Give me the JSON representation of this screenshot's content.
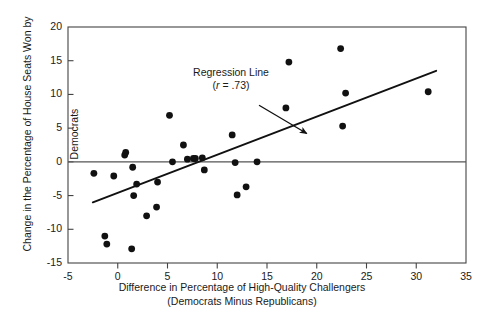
{
  "chart_data": {
    "type": "scatter",
    "title": "",
    "xlabel": "Difference in Percentage of High-Quality Challengers (Democrats Minus Republicans)",
    "xlabel_line1": "Difference in Percentage of High-Quality Challengers",
    "xlabel_line2": "(Democrats Minus Republicans)",
    "ylabel": "Change in the Percentage of House Seats Won by Democrats",
    "ylabel_line1": "Change in the Percentage of House Seats Won by",
    "ylabel_line2": "Democrats",
    "xlim": [
      -5,
      35
    ],
    "ylim": [
      -15,
      20
    ],
    "xticks": [
      -5,
      0,
      5,
      10,
      15,
      20,
      25,
      30,
      35
    ],
    "xtick_labels": [
      "-5",
      "0",
      "5",
      "10",
      "15",
      "20",
      "25",
      "30",
      "35"
    ],
    "yticks": [
      -15,
      -10,
      -5,
      0,
      5,
      10,
      15,
      20
    ],
    "ytick_labels": [
      "-15",
      "-10",
      "-5",
      "0",
      "5",
      "10",
      "15",
      "20"
    ],
    "grid": false,
    "legend": null,
    "zero_line": 0,
    "point_color": "#111111",
    "point_size": 3.4,
    "line_color": "#111111",
    "points": [
      {
        "x": -2.4,
        "y": -1.7
      },
      {
        "x": -1.3,
        "y": -11.0
      },
      {
        "x": -1.1,
        "y": -12.2
      },
      {
        "x": -0.4,
        "y": -2.1
      },
      {
        "x": 0.7,
        "y": 1.0
      },
      {
        "x": 0.8,
        "y": 1.4
      },
      {
        "x": 1.4,
        "y": -12.9
      },
      {
        "x": 1.5,
        "y": -0.8
      },
      {
        "x": 1.6,
        "y": -5.0
      },
      {
        "x": 1.9,
        "y": -3.3
      },
      {
        "x": 2.9,
        "y": -8.0
      },
      {
        "x": 3.9,
        "y": -6.7
      },
      {
        "x": 4.0,
        "y": -3.0
      },
      {
        "x": 5.2,
        "y": 6.9
      },
      {
        "x": 5.5,
        "y": 0.0
      },
      {
        "x": 6.6,
        "y": 2.5
      },
      {
        "x": 7.0,
        "y": 0.4
      },
      {
        "x": 7.6,
        "y": 0.5
      },
      {
        "x": 7.8,
        "y": 0.5
      },
      {
        "x": 8.5,
        "y": 0.6
      },
      {
        "x": 8.7,
        "y": -1.2
      },
      {
        "x": 11.5,
        "y": 4.0
      },
      {
        "x": 11.8,
        "y": -0.1
      },
      {
        "x": 12.0,
        "y": -4.9
      },
      {
        "x": 12.9,
        "y": -3.7
      },
      {
        "x": 14.0,
        "y": 0.0
      },
      {
        "x": 16.9,
        "y": 8.0
      },
      {
        "x": 17.2,
        "y": 14.8
      },
      {
        "x": 22.4,
        "y": 16.8
      },
      {
        "x": 22.6,
        "y": 5.3
      },
      {
        "x": 22.9,
        "y": 10.2
      },
      {
        "x": 31.2,
        "y": 10.4
      }
    ],
    "regression_line": {
      "label_line1": "Regression Line",
      "label_line2_prefix": "(",
      "label_line2_r": "r",
      "label_line2_rest": " = .73)",
      "label_full": "Regression Line (r = .73)",
      "r": 0.73,
      "x_start": -2.5,
      "y_start": -6.0,
      "x_end": 32.0,
      "y_end": 13.5
    },
    "annotation_arrow": {
      "from_x": 14.2,
      "from_y": 8.4,
      "to_x": 19.0,
      "to_y": 4.2
    }
  }
}
